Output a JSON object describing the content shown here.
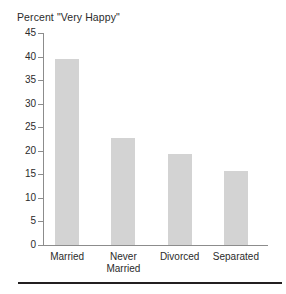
{
  "chart_data": {
    "type": "bar",
    "title": "Percent \"Very Happy\"",
    "xlabel": "",
    "ylabel": "",
    "categories": [
      "Married",
      "Never Married",
      "Divorced",
      "Separated"
    ],
    "category_lines": [
      [
        "Married"
      ],
      [
        "Never",
        "Married"
      ],
      [
        "Divorced"
      ],
      [
        "Separated"
      ]
    ],
    "values": [
      39.5,
      22.7,
      19.4,
      15.7
    ],
    "ylim": [
      0,
      45
    ],
    "yticks": [
      0,
      5,
      10,
      15,
      20,
      25,
      30,
      35,
      40,
      45
    ],
    "ytick_labels": [
      "0",
      "5",
      "10",
      "15",
      "20",
      "25",
      "30",
      "35",
      "40",
      "45"
    ],
    "grid": false,
    "legend": null,
    "bar_color": "#d3d3d3",
    "axis_color": "#8c8c8c",
    "text_color": "#2b2b2b"
  }
}
